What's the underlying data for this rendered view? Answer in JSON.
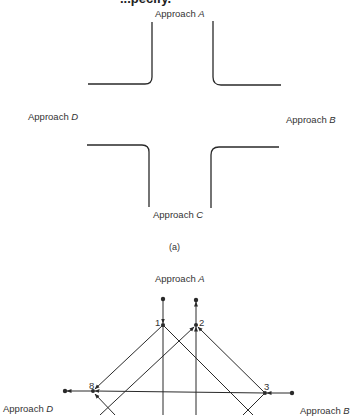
{
  "header": {
    "partial_title": "...pecify."
  },
  "panel_a": {
    "labels": {
      "approach_a_prefix": "Approach ",
      "approach_a_letter": "A",
      "approach_b_prefix": "Approach ",
      "approach_b_letter": "B",
      "approach_c_prefix": "Approach ",
      "approach_c_letter": "C",
      "approach_d_prefix": "Approach ",
      "approach_d_letter": "D"
    },
    "caption": "(a)"
  },
  "panel_b": {
    "labels": {
      "approach_a_prefix": "Approach ",
      "approach_a_letter": "A",
      "approach_b_prefix": "Approach ",
      "approach_b_letter": "B",
      "approach_d_prefix": "Approach ",
      "approach_d_letter": "D"
    },
    "nodes": [
      "1",
      "2",
      "3",
      "8"
    ]
  },
  "colors": {
    "line": "#2a2a2a",
    "background": "#ffffff"
  }
}
